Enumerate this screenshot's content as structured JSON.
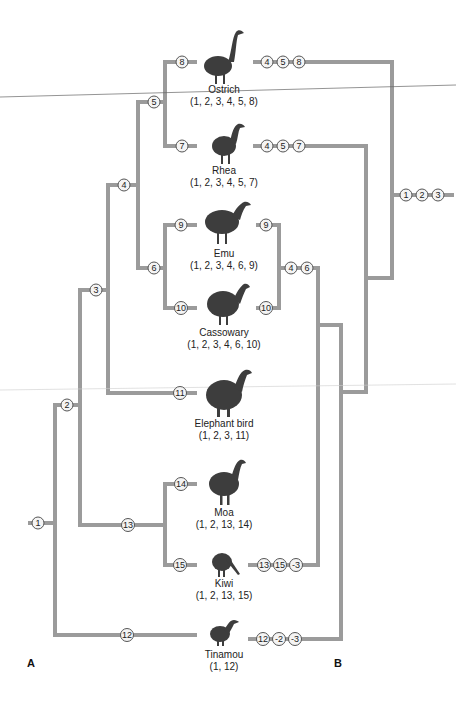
{
  "panels": {
    "a": "A",
    "b": "B"
  },
  "taxa": [
    {
      "name": "Ostrich",
      "chars": "(1, 2, 3, 4, 5, 8)"
    },
    {
      "name": "Rhea",
      "chars": "(1, 2, 3, 4, 5, 7)"
    },
    {
      "name": "Emu",
      "chars": "(1, 2, 3, 4, 6, 9)"
    },
    {
      "name": "Cassowary",
      "chars": "(1, 2, 3, 4, 6, 10)"
    },
    {
      "name": "Elephant bird",
      "chars": "(1, 2, 3, 11)"
    },
    {
      "name": "Moa",
      "chars": "(1, 2, 13, 14)"
    },
    {
      "name": "Kiwi",
      "chars": "(1, 2, 13, 15)"
    },
    {
      "name": "Tinamou",
      "chars": "(1, 12)"
    }
  ],
  "tree_a_nodes": [
    "1",
    "2",
    "3",
    "4",
    "5",
    "6",
    "7",
    "8",
    "9",
    "10",
    "11",
    "12",
    "13",
    "14",
    "15"
  ],
  "tree_b_nodes": {
    "ostrich": [
      "4",
      "5",
      "8"
    ],
    "rhea": [
      "4",
      "5",
      "7"
    ],
    "emu": [
      "9"
    ],
    "cassowary": [
      "10"
    ],
    "emu_cassowary": [
      "4",
      "6"
    ],
    "kiwi": [
      "13",
      "15",
      "-3"
    ],
    "tinamou": [
      "12",
      "-2",
      "-3"
    ],
    "root": [
      "1",
      "2",
      "3"
    ]
  },
  "colors": {
    "branch": "#9b9b9b",
    "bird": "#3d3d3d"
  }
}
